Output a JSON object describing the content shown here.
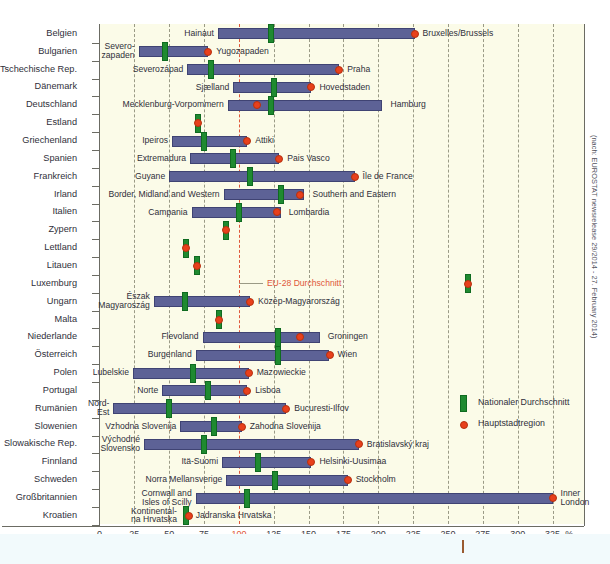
{
  "chart_data": {
    "type": "bar",
    "title": "",
    "xlabel": "%",
    "ylabel": "",
    "xlim": [
      0,
      337
    ],
    "xticks": [
      0,
      25,
      50,
      75,
      100,
      125,
      150,
      175,
      200,
      225,
      250,
      275,
      300,
      325
    ],
    "unit_label": "%",
    "grid": "vertical dashed, EU-28 reference line at 100 in red",
    "reference_line": {
      "value": 100,
      "label": "EU-28 Durchschnitt",
      "color": "#e0573a"
    },
    "legend": {
      "position": "inside-right",
      "entries": [
        {
          "label": "Nationaler Durchschnitt",
          "marker": "green-bar",
          "color": "#1f8a30"
        },
        {
          "label": "Hauptstadtregion",
          "marker": "red-dot",
          "color": "#e8401c"
        }
      ]
    },
    "source_note": "(nach: EUROSTAT newsrelease 29/2014 - 27. February 2014)",
    "categories": [
      "Belgien",
      "Bulgarien",
      "Tschechische Rep.",
      "Dänemark",
      "Deutschland",
      "Estland",
      "Griechenland",
      "Spanien",
      "Frankreich",
      "Irland",
      "Italien",
      "Zypern",
      "Lettland",
      "Litauen",
      "Luxemburg",
      "Ungarn",
      "Malta",
      "Niederlande",
      "Österreich",
      "Polen",
      "Portugal",
      "Rumänien",
      "Slowenien",
      "Slowakische Rep.",
      "Finnland",
      "Schweden",
      "Großbritannien",
      "Kroatien"
    ],
    "rows": [
      {
        "country": "Belgien",
        "low_label": "Hainaut",
        "high_label": "Bruxelles/Brussels",
        "low": 85,
        "high": 226,
        "national": 123,
        "capital": 226
      },
      {
        "country": "Bulgarien",
        "low_label": "Severo-\nzapaden",
        "high_label": "Yugozapaden",
        "low": 28,
        "high": 78,
        "national": 47,
        "capital": 78
      },
      {
        "country": "Tschechische Rep.",
        "low_label": "Severozápad",
        "high_label": "Praha",
        "low": 63,
        "high": 172,
        "national": 80,
        "capital": 172
      },
      {
        "country": "Dänemark",
        "low_label": "Sjælland",
        "high_label": "Hovedstaden",
        "low": 96,
        "high": 152,
        "national": 125,
        "capital": 152
      },
      {
        "country": "Deutschland",
        "low_label": "Mecklenburg-Vorpommern",
        "high_label": "Hamburg",
        "low": 92,
        "high": 203,
        "national": 123,
        "capital": 113
      },
      {
        "country": "Estland",
        "low_label": "",
        "high_label": "",
        "low": null,
        "high": null,
        "national": 71,
        "capital": 71
      },
      {
        "country": "Griechenland",
        "low_label": "Ipeiros",
        "high_label": "Attiki",
        "low": 52,
        "high": 106,
        "national": 75,
        "capital": 106
      },
      {
        "country": "Spanien",
        "low_label": "Extremadura",
        "high_label": "Pais Vasco",
        "low": 65,
        "high": 129,
        "national": 96,
        "capital": 129
      },
      {
        "country": "Frankreich",
        "low_label": "Guyane",
        "high_label": "Île de France",
        "low": 50,
        "high": 183,
        "national": 108,
        "capital": 183
      },
      {
        "country": "Irland",
        "low_label": "Border, Midland and Western",
        "high_label": "Southern and Eastern",
        "low": 89,
        "high": 147,
        "national": 130,
        "capital": 144
      },
      {
        "country": "Italien",
        "low_label": "Campania",
        "high_label": "Lombardia",
        "low": 66,
        "high": 130,
        "national": 100,
        "capital": 127
      },
      {
        "country": "Zypern",
        "low_label": "",
        "high_label": "",
        "low": null,
        "high": null,
        "national": 91,
        "capital": 91
      },
      {
        "country": "Lettland",
        "low_label": "",
        "high_label": "",
        "low": null,
        "high": null,
        "national": 62,
        "capital": 62
      },
      {
        "country": "Litauen",
        "low_label": "",
        "high_label": "",
        "low": null,
        "high": null,
        "national": 70,
        "capital": 70
      },
      {
        "country": "Luxemburg",
        "low_label": "",
        "high_label": "",
        "low": null,
        "high": null,
        "national": 264,
        "capital": 264
      },
      {
        "country": "Ungarn",
        "low_label": "Észak\nMagyaroszág",
        "high_label": "Közép-Magyarország",
        "low": 39,
        "high": 108,
        "national": 61,
        "capital": 108
      },
      {
        "country": "Malta",
        "low_label": "",
        "high_label": "",
        "low": null,
        "high": null,
        "national": 86,
        "capital": 86
      },
      {
        "country": "Niederlande",
        "low_label": "Flevoland",
        "high_label": "Groningen",
        "low": 74,
        "high": 158,
        "national": 128,
        "capital": 144
      },
      {
        "country": "Österreich",
        "low_label": "Burgenland",
        "high_label": "Wien",
        "low": 69,
        "high": 165,
        "national": 128,
        "capital": 165
      },
      {
        "country": "Polen",
        "low_label": "Lubelskie",
        "high_label": "Mazowieckie",
        "low": 24,
        "high": 107,
        "national": 67,
        "capital": 107
      },
      {
        "country": "Portugal",
        "low_label": "Norte",
        "high_label": "Lisboa",
        "low": 45,
        "high": 106,
        "national": 78,
        "capital": 106
      },
      {
        "country": "Rumänien",
        "low_label": "Nord-\nEst",
        "high_label": "Bucuresti-Ilfov",
        "low": 10,
        "high": 134,
        "national": 50,
        "capital": 134
      },
      {
        "country": "Slowenien",
        "low_label": "Vzhodna Slovenija",
        "high_label": "Zahodna Slovenija",
        "low": 58,
        "high": 102,
        "national": 82,
        "capital": 102
      },
      {
        "country": "Slowakische Rep.",
        "low_label": "Východné\nSlovensko",
        "high_label": "Bratislavský kraj",
        "low": 32,
        "high": 186,
        "national": 75,
        "capital": 186
      },
      {
        "country": "Finnland",
        "low_label": "Itä-Suomi",
        "high_label": "Helsinki-Uusimaa",
        "low": 88,
        "high": 152,
        "national": 114,
        "capital": 152
      },
      {
        "country": "Schweden",
        "low_label": "Norra Mellansverige",
        "high_label": "Stockholm",
        "low": 91,
        "high": 178,
        "national": 126,
        "capital": 178
      },
      {
        "country": "Großbritannien",
        "low_label": "Cornwall and\nIsles of Scilly",
        "high_label": "Inner\nLondon",
        "low": 69,
        "high": 325,
        "national": 106,
        "capital": 325
      },
      {
        "country": "Kroatien",
        "low_label": "Kontinental-\nna Hrvatska",
        "high_label": "Jadranska Hrvatska",
        "low": null,
        "high": null,
        "national": 62,
        "capital": 64
      }
    ]
  },
  "axis": {
    "unit": "%",
    "ticks": [
      "0",
      "25",
      "50",
      "75",
      "100",
      "125",
      "150",
      "175",
      "200",
      "225",
      "250",
      "275",
      "300",
      "325"
    ]
  },
  "annotation": {
    "eu28": "EU-28 Durchschnitt"
  },
  "legend": {
    "national": "Nationaler Durchschnitt",
    "capital": "Hauptstadtregion"
  },
  "source": "(nach: EUROSTAT newsrelease 29/2014 - 27. February 2014)",
  "caption": ""
}
